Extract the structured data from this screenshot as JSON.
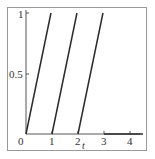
{
  "chart_data": {
    "type": "line",
    "title": "",
    "xlabel": "t",
    "ylabel": "",
    "xlim": [
      0,
      4.6
    ],
    "ylim": [
      0,
      1
    ],
    "x_ticks": [
      "0",
      "1",
      "2",
      "3",
      "4"
    ],
    "y_ticks": [
      "0.5",
      "1"
    ],
    "grid": false,
    "legend": null,
    "series": [
      {
        "name": "ramp-1",
        "x": [
          0,
          0.96
        ],
        "y": [
          0,
          1
        ]
      },
      {
        "name": "ramp-2",
        "x": [
          1,
          1.96
        ],
        "y": [
          0,
          1
        ]
      },
      {
        "name": "ramp-3",
        "x": [
          2,
          2.96
        ],
        "y": [
          0,
          1
        ]
      },
      {
        "name": "baseline",
        "x": [
          3,
          4.5
        ],
        "y": [
          0,
          0
        ]
      }
    ],
    "colors": {
      "line": "#2a2a2a",
      "axis": "#555555",
      "frame": "#9a9a9a"
    }
  },
  "labels": {
    "x0": "0",
    "x1": "1",
    "x2": "2",
    "x3": "3",
    "x4": "4",
    "y_half": "0.5",
    "y_one": "1",
    "x_axis_name": "t"
  }
}
